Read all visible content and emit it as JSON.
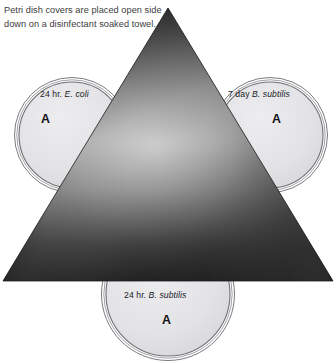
{
  "caption": {
    "text": "Petri dish covers are placed open side down on a disinfectant soaked towel."
  },
  "diagram": {
    "towel": {
      "name": "disinfectant-soaked-towel",
      "shape": "triangle",
      "apex": [
        168,
        8
      ],
      "base_left": [
        3,
        281
      ],
      "base_right": [
        333,
        281
      ],
      "fill_light": "#b4b4b4",
      "fill_mid": "#8c8c8c",
      "fill_dark": "#272727"
    },
    "dishes": [
      {
        "id": "left",
        "label_time": "24 hr.",
        "label_species": "E. coli",
        "letter": "A",
        "center": [
          72,
          135
        ],
        "radius": 57,
        "fill": "#e3e3e6",
        "rim": "#6e6e72"
      },
      {
        "id": "right",
        "label_time": "7 day",
        "label_species": "B. subtilis",
        "letter": "A",
        "center": [
          270,
          135
        ],
        "radius": 57,
        "fill": "#e3e3e6",
        "rim": "#6e6e72"
      },
      {
        "id": "bottom",
        "label_time": "24 hr.",
        "label_species": "B. subtilis",
        "letter": "A",
        "center": [
          168,
          294
        ],
        "radius": 66,
        "fill": "#e3e3e6",
        "rim": "#6e6e72"
      }
    ]
  }
}
